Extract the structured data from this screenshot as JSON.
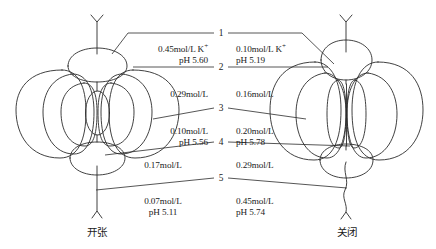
{
  "figure": {
    "background_color": "#ffffff",
    "line_color": "#2b2b2b"
  },
  "captions": {
    "open": "开张",
    "closed": "关闭"
  },
  "markers": [
    {
      "id": "1",
      "label": "1"
    },
    {
      "id": "2",
      "label": "2"
    },
    {
      "id": "3",
      "label": "3"
    },
    {
      "id": "4",
      "label": "4"
    },
    {
      "id": "5",
      "label": "5"
    }
  ],
  "left_values": [
    {
      "id": "1",
      "conc": "0.45mol/L K",
      "ion_charge": "+",
      "ph": "pH 5.60"
    },
    {
      "id": "2",
      "conc": "0.29mol/L",
      "ion_charge": "",
      "ph": ""
    },
    {
      "id": "3",
      "conc": "0.10mol/L",
      "ion_charge": "",
      "ph": "pH 5.56"
    },
    {
      "id": "4",
      "conc": "0.17mol/L",
      "ion_charge": "",
      "ph": ""
    },
    {
      "id": "5",
      "conc": "0.07mol/L",
      "ion_charge": "",
      "ph": "pH 5.11"
    }
  ],
  "right_values": [
    {
      "id": "1",
      "conc": "0.10mol/L K",
      "ion_charge": "+",
      "ph": "pH 5.19"
    },
    {
      "id": "2",
      "conc": "0.16mol/L",
      "ion_charge": "",
      "ph": ""
    },
    {
      "id": "3",
      "conc": "0.20mol/L",
      "ion_charge": "",
      "ph": "pH 5.78"
    },
    {
      "id": "4",
      "conc": "0.29mol/L",
      "ion_charge": "",
      "ph": ""
    },
    {
      "id": "5",
      "conc": "0.45mol/L",
      "ion_charge": "",
      "ph": "pH 5.74"
    }
  ]
}
